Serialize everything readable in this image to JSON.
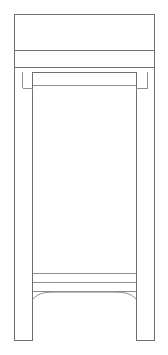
{
  "document": {
    "kind": "technical-line-drawing",
    "view": "front-elevation",
    "subject": "side-table-stand",
    "caption": "",
    "background_color": "#ffffff",
    "line_color": "#6f6f6f",
    "line_color_light": "#8d8d8d",
    "fill_color": "#ffffff",
    "canvas_width": 168,
    "canvas_height": 355
  },
  "drawing": {
    "bounds": {
      "left": 14,
      "top": 14,
      "right": 155,
      "bottom": 341
    },
    "parts": [
      {
        "id": "top-slab",
        "label": "Top slab",
        "x": 14,
        "y": 14,
        "width": 141,
        "height": 36,
        "divider_y": 50
      },
      {
        "id": "top-lower-band",
        "label": "Top lower band",
        "x": 14,
        "y": 50,
        "width": 141,
        "height": 17
      },
      {
        "id": "apron-rail",
        "label": "Apron rail",
        "x": 14,
        "y": 67,
        "width": 141,
        "height": 5
      },
      {
        "id": "leg-left",
        "label": "Left leg",
        "x": 14,
        "y": 72,
        "width": 19,
        "height": 269,
        "inner_line_x": 22,
        "inner_line_bottom_y": 88
      },
      {
        "id": "leg-right",
        "label": "Right leg",
        "x": 136,
        "y": 72,
        "width": 19,
        "height": 269,
        "inner_line_x": 147,
        "inner_line_bottom_y": 88
      },
      {
        "id": "inner-panel",
        "label": "Inner panel",
        "x": 33,
        "y": 85,
        "width": 103,
        "height": 188
      },
      {
        "id": "lower-rail",
        "label": "Lower rail",
        "x": 33,
        "y": 273,
        "width": 103,
        "height": 9
      },
      {
        "id": "stretcher",
        "label": "Stretcher",
        "x": 33,
        "y": 282,
        "width": 103,
        "height": 9
      },
      {
        "id": "arched-apron",
        "label": "Arched apron",
        "x": 33,
        "y": 291,
        "width": 103,
        "height": 8,
        "arch_peak_y": 292,
        "arch_spring_y": 299
      }
    ]
  }
}
